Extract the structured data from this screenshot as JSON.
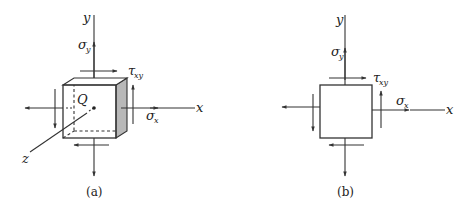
{
  "figures": [
    {
      "id": "a",
      "caption": "(a)",
      "type": "3d-stress-element",
      "labels": {
        "y_axis": "y",
        "x_axis": "x",
        "z_axis": "z",
        "origin": "Q",
        "sigma_y": "σ",
        "sigma_y_sub": "y",
        "sigma_x": "σ",
        "sigma_x_sub": "x",
        "tau_xy": "τ",
        "tau_xy_sub": "xy"
      }
    },
    {
      "id": "b",
      "caption": "(b)",
      "type": "2d-stress-element",
      "labels": {
        "y_axis": "y",
        "x_axis": "x",
        "sigma_y": "σ",
        "sigma_y_sub": "y",
        "sigma_x": "σ",
        "sigma_x_sub": "x",
        "tau_xy": "τ",
        "tau_xy_sub": "xy"
      }
    }
  ],
  "colors": {
    "line": "#333333",
    "shaded_face": "#b8b8b8",
    "background": "#ffffff"
  }
}
